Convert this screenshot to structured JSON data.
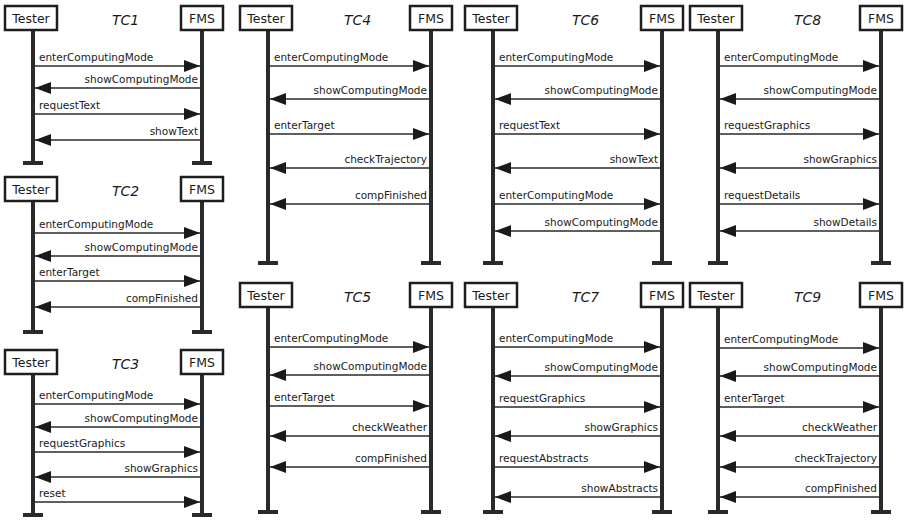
{
  "participants": {
    "left": "Tester",
    "right": "FMS"
  },
  "colors": {
    "ink": "#1a1a1a",
    "background": "#ffffff"
  },
  "diagrams": [
    {
      "id": "TC1",
      "title": "TC1",
      "frame": {
        "x": 5,
        "y": 6,
        "w": 218,
        "lifeline_end": 163
      },
      "messages": [
        {
          "label": "enterComputingMode",
          "dir": "right",
          "y": 66
        },
        {
          "label": "showComputingMode",
          "dir": "left",
          "y": 88
        },
        {
          "label": "requestText",
          "dir": "right",
          "y": 114
        },
        {
          "label": "showText",
          "dir": "left",
          "y": 140
        }
      ]
    },
    {
      "id": "TC2",
      "title": "TC2",
      "frame": {
        "x": 5,
        "y": 177,
        "w": 218,
        "lifeline_end": 332
      },
      "messages": [
        {
          "label": "enterComputingMode",
          "dir": "right",
          "y": 233
        },
        {
          "label": "showComputingMode",
          "dir": "left",
          "y": 256
        },
        {
          "label": "enterTarget",
          "dir": "right",
          "y": 281
        },
        {
          "label": "compFinished",
          "dir": "left",
          "y": 307
        }
      ]
    },
    {
      "id": "TC3",
      "title": "TC3",
      "frame": {
        "x": 5,
        "y": 350,
        "w": 218,
        "lifeline_end": 515
      },
      "messages": [
        {
          "label": "enterComputingMode",
          "dir": "right",
          "y": 404
        },
        {
          "label": "showComputingMode",
          "dir": "left",
          "y": 427
        },
        {
          "label": "requestGraphics",
          "dir": "right",
          "y": 452
        },
        {
          "label": "showGraphics",
          "dir": "left",
          "y": 477
        },
        {
          "label": "reset",
          "dir": "right",
          "y": 502
        }
      ]
    },
    {
      "id": "TC4",
      "title": "TC4",
      "frame": {
        "x": 240,
        "y": 6,
        "w": 212,
        "lifeline_end": 263
      },
      "messages": [
        {
          "label": "enterComputingMode",
          "dir": "right",
          "y": 66
        },
        {
          "label": "showComputingMode",
          "dir": "left",
          "y": 99
        },
        {
          "label": "enterTarget",
          "dir": "right",
          "y": 134
        },
        {
          "label": "checkTrajectory",
          "dir": "left",
          "y": 168
        },
        {
          "label": "compFinished",
          "dir": "left",
          "y": 204
        }
      ]
    },
    {
      "id": "TC5",
      "title": "TC5",
      "frame": {
        "x": 240,
        "y": 283,
        "w": 212,
        "lifeline_end": 512
      },
      "messages": [
        {
          "label": "enterComputingMode",
          "dir": "right",
          "y": 347
        },
        {
          "label": "showComputingMode",
          "dir": "left",
          "y": 375
        },
        {
          "label": "enterTarget",
          "dir": "right",
          "y": 406
        },
        {
          "label": "checkWeather",
          "dir": "left",
          "y": 436
        },
        {
          "label": "compFinished",
          "dir": "left",
          "y": 467
        }
      ]
    },
    {
      "id": "TC6",
      "title": "TC6",
      "frame": {
        "x": 465,
        "y": 6,
        "w": 218,
        "lifeline_end": 263
      },
      "messages": [
        {
          "label": "enterComputingMode",
          "dir": "right",
          "y": 66
        },
        {
          "label": "showComputingMode",
          "dir": "left",
          "y": 99
        },
        {
          "label": "requestText",
          "dir": "right",
          "y": 134
        },
        {
          "label": "showText",
          "dir": "left",
          "y": 168
        },
        {
          "label": "enterComputingMode",
          "dir": "right",
          "y": 204
        },
        {
          "label": "showComputingMode",
          "dir": "left",
          "y": 231
        }
      ]
    },
    {
      "id": "TC7",
      "title": "TC7",
      "frame": {
        "x": 465,
        "y": 283,
        "w": 218,
        "lifeline_end": 512
      },
      "messages": [
        {
          "label": "enterComputingMode",
          "dir": "right",
          "y": 347
        },
        {
          "label": "showComputingMode",
          "dir": "left",
          "y": 376
        },
        {
          "label": "requestGraphics",
          "dir": "right",
          "y": 407
        },
        {
          "label": "showGraphics",
          "dir": "left",
          "y": 436
        },
        {
          "label": "requestAbstracts",
          "dir": "right",
          "y": 467
        },
        {
          "label": "showAbstracts",
          "dir": "left",
          "y": 497
        }
      ]
    },
    {
      "id": "TC8",
      "title": "TC8",
      "frame": {
        "x": 690,
        "y": 6,
        "w": 212,
        "lifeline_end": 263
      },
      "messages": [
        {
          "label": "enterComputingMode",
          "dir": "right",
          "y": 66
        },
        {
          "label": "showComputingMode",
          "dir": "left",
          "y": 99
        },
        {
          "label": "requestGraphics",
          "dir": "right",
          "y": 134
        },
        {
          "label": "showGraphics",
          "dir": "left",
          "y": 168
        },
        {
          "label": "requestDetails",
          "dir": "right",
          "y": 204
        },
        {
          "label": "showDetails",
          "dir": "left",
          "y": 231
        }
      ]
    },
    {
      "id": "TC9",
      "title": "TC9",
      "frame": {
        "x": 690,
        "y": 283,
        "w": 212,
        "lifeline_end": 512
      },
      "messages": [
        {
          "label": "enterComputingMode",
          "dir": "right",
          "y": 348
        },
        {
          "label": "showComputingMode",
          "dir": "left",
          "y": 376
        },
        {
          "label": "enterTarget",
          "dir": "right",
          "y": 407
        },
        {
          "label": "checkWeather",
          "dir": "left",
          "y": 436
        },
        {
          "label": "checkTrajectory",
          "dir": "left",
          "y": 467
        },
        {
          "label": "compFinished",
          "dir": "left",
          "y": 497
        }
      ]
    }
  ]
}
